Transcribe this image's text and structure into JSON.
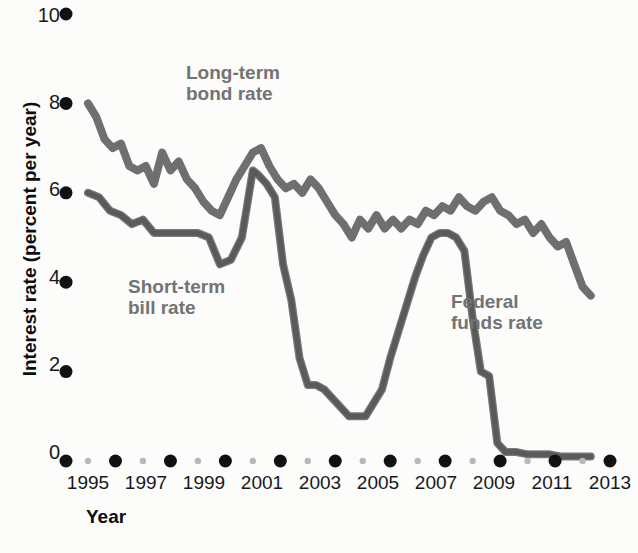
{
  "chart_data": {
    "type": "line",
    "title": "",
    "xlabel": "Year",
    "ylabel": "Interest rate (percent per year)",
    "xlim": [
      1994,
      2013
    ],
    "ylim": [
      0,
      10
    ],
    "grid": false,
    "legend_position": "inline-annotations",
    "x_ticks_major": [
      "1995",
      "1997",
      "1999",
      "2001",
      "2003",
      "2005",
      "2007",
      "2009",
      "2011",
      "2013"
    ],
    "x_ticks_minor": [
      "1994",
      "1996",
      "1998",
      "2000",
      "2002",
      "2004",
      "2006",
      "2008",
      "2010",
      "2012"
    ],
    "y_ticks": [
      "0",
      "2",
      "4",
      "6",
      "8",
      "10"
    ],
    "series": [
      {
        "name": "Long-term bond rate",
        "color": "#6f6f6f",
        "x": [
          1994.0,
          1994.3,
          1994.6,
          1994.9,
          1995.2,
          1995.5,
          1995.8,
          1996.1,
          1996.4,
          1996.7,
          1997.0,
          1997.3,
          1997.6,
          1997.9,
          1998.2,
          1998.5,
          1998.8,
          1999.1,
          1999.4,
          1999.7,
          2000.0,
          2000.3,
          2000.6,
          2000.9,
          2001.2,
          2001.5,
          2001.8,
          2002.1,
          2002.4,
          2002.7,
          2003.0,
          2003.3,
          2003.6,
          2003.9,
          2004.2,
          2004.5,
          2004.8,
          2005.1,
          2005.4,
          2005.7,
          2006.0,
          2006.3,
          2006.6,
          2006.9,
          2007.2,
          2007.5,
          2007.8,
          2008.1,
          2008.4,
          2008.7,
          2009.0,
          2009.3,
          2009.6,
          2009.9,
          2010.2,
          2010.5,
          2010.8,
          2011.1,
          2011.4,
          2011.7,
          2012.0,
          2012.3
        ],
        "y": [
          8.0,
          7.7,
          7.2,
          7.0,
          7.1,
          6.6,
          6.5,
          6.6,
          6.2,
          6.9,
          6.5,
          6.7,
          6.3,
          6.1,
          5.8,
          5.6,
          5.5,
          5.9,
          6.3,
          6.6,
          6.9,
          7.0,
          6.6,
          6.3,
          6.1,
          6.2,
          6.0,
          6.3,
          6.1,
          5.8,
          5.5,
          5.3,
          5.0,
          5.4,
          5.2,
          5.5,
          5.2,
          5.4,
          5.2,
          5.4,
          5.3,
          5.6,
          5.5,
          5.7,
          5.6,
          5.9,
          5.7,
          5.6,
          5.8,
          5.9,
          5.6,
          5.5,
          5.3,
          5.4,
          5.1,
          5.3,
          5.0,
          4.8,
          4.9,
          4.4,
          3.9,
          3.7
        ]
      },
      {
        "name": "Short-term bill rate",
        "color": "#7a7a7a",
        "x": [
          1994.0,
          1994.4,
          1994.8,
          1995.2,
          1995.6,
          1996.0,
          1996.4,
          1996.8,
          1997.2,
          1997.6,
          1998.0,
          1998.4,
          1998.8,
          1999.2,
          1999.6,
          2000.0,
          2000.2,
          2000.5,
          2000.8,
          2001.1,
          2001.4,
          2001.7,
          2002.0,
          2002.3,
          2002.6,
          2002.9,
          2003.2,
          2003.5,
          2003.8,
          2004.1,
          2004.4,
          2004.7,
          2005.0,
          2005.3,
          2005.6,
          2005.9,
          2006.2,
          2006.5,
          2006.8,
          2007.1,
          2007.4,
          2007.7,
          2008.0,
          2008.3,
          2008.6,
          2008.9,
          2009.2,
          2009.6,
          2010.0,
          2010.4,
          2010.8,
          2011.2,
          2011.6,
          2012.0,
          2012.3
        ],
        "y": [
          6.0,
          5.9,
          5.6,
          5.5,
          5.3,
          5.4,
          5.1,
          5.1,
          5.1,
          5.1,
          5.1,
          5.0,
          4.4,
          4.5,
          5.0,
          6.5,
          6.4,
          6.2,
          5.9,
          4.4,
          3.6,
          2.3,
          1.7,
          1.7,
          1.6,
          1.4,
          1.2,
          1.0,
          1.0,
          1.0,
          1.3,
          1.6,
          2.3,
          2.9,
          3.5,
          4.1,
          4.6,
          5.0,
          5.1,
          5.1,
          5.0,
          4.7,
          3.2,
          2.0,
          1.9,
          0.4,
          0.2,
          0.2,
          0.15,
          0.15,
          0.15,
          0.1,
          0.1,
          0.1,
          0.1
        ]
      },
      {
        "name": "Federal funds rate",
        "color": "#555555",
        "x": [
          1994.0,
          1994.4,
          1994.8,
          1995.2,
          1995.6,
          1996.0,
          1996.4,
          1996.8,
          1997.2,
          1997.6,
          1998.0,
          1998.4,
          1998.8,
          1999.2,
          1999.6,
          2000.0,
          2000.2,
          2000.5,
          2000.8,
          2001.1,
          2001.4,
          2001.7,
          2002.0,
          2002.3,
          2002.6,
          2002.9,
          2003.2,
          2003.5,
          2003.8,
          2004.1,
          2004.4,
          2004.7,
          2005.0,
          2005.3,
          2005.6,
          2005.9,
          2006.2,
          2006.5,
          2006.8,
          2007.1,
          2007.4,
          2007.7,
          2008.0,
          2008.3,
          2008.6,
          2008.9,
          2009.2,
          2009.6,
          2010.0,
          2010.4,
          2010.8,
          2011.2,
          2011.6,
          2012.0,
          2012.3
        ],
        "y": [
          6.0,
          5.9,
          5.6,
          5.5,
          5.3,
          5.4,
          5.1,
          5.1,
          5.1,
          5.1,
          5.1,
          5.0,
          4.4,
          4.5,
          5.0,
          6.5,
          6.4,
          6.2,
          5.9,
          4.4,
          3.6,
          2.3,
          1.7,
          1.7,
          1.6,
          1.4,
          1.2,
          1.0,
          1.0,
          1.0,
          1.3,
          1.6,
          2.3,
          2.9,
          3.5,
          4.1,
          4.6,
          5.0,
          5.1,
          5.1,
          5.0,
          4.7,
          3.2,
          2.0,
          1.9,
          0.4,
          0.2,
          0.2,
          0.15,
          0.15,
          0.15,
          0.1,
          0.1,
          0.1,
          0.1
        ]
      }
    ],
    "annotations": [
      {
        "text": "Long-term bond rate",
        "x": 1999.0,
        "y": 9.0
      },
      {
        "text": "Short-term bill rate",
        "x": 1997.0,
        "y": 4.2
      },
      {
        "text": "Federal funds rate",
        "x": 2008.0,
        "y": 3.9
      }
    ]
  },
  "axis": {
    "y_title": "Interest rate (percent per year)",
    "x_title": "Year",
    "y_tick_labels": [
      "10",
      "8",
      "6",
      "4",
      "2",
      "0"
    ],
    "x_tick_labels": [
      "1995",
      "1997",
      "1999",
      "2001",
      "2003",
      "2005",
      "2007",
      "2009",
      "2011",
      "2013"
    ]
  },
  "labels": {
    "long_term_bond": "Long-term\nbond rate",
    "short_term_bill": "Short-term\nbill rate",
    "federal_funds": "Federal\nfunds rate"
  },
  "colors": {
    "background": "#fcfcfb",
    "bond_line": "#6f6f6f",
    "bill_line": "#7a7a7a",
    "funds_line": "#555555",
    "major_tick": "#111111",
    "minor_tick": "#b8b8b8",
    "text": "#18181a",
    "annotation_text": "#737373"
  }
}
